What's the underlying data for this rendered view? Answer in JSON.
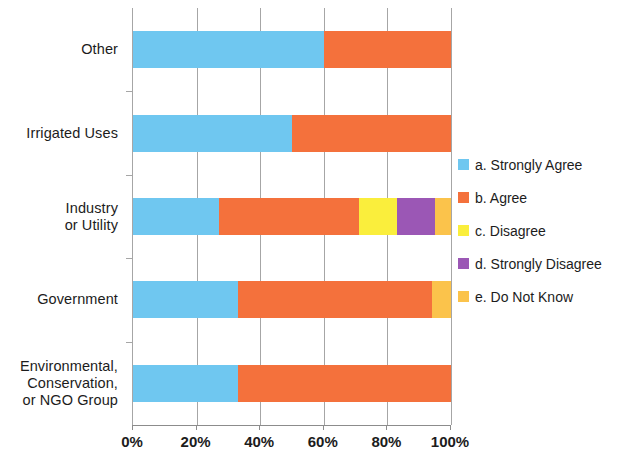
{
  "chart_data": {
    "type": "bar",
    "orientation": "horizontal",
    "stacked": true,
    "normalized": "100%",
    "title": "",
    "subtitle": "",
    "xlabel": "",
    "ylabel": "",
    "xlim": [
      0,
      100
    ],
    "xticks": [
      0,
      20,
      40,
      60,
      80,
      100
    ],
    "xtick_labels": [
      "0%",
      "20%",
      "40%",
      "60%",
      "80%",
      "100%"
    ],
    "grid": "vertical",
    "legend_position": "right",
    "categories": [
      "Other",
      "Irrigated Uses",
      "Industry\nor Utility",
      "Government",
      "Environmental,\nConservation,\nor NGO Group"
    ],
    "category_lines": [
      [
        "Other"
      ],
      [
        "Irrigated Uses"
      ],
      [
        "Industry",
        "or Utility"
      ],
      [
        "Government"
      ],
      [
        "Environmental,",
        "Conservation,",
        "or NGO Group"
      ]
    ],
    "series": [
      {
        "name": "a. Strongly Agree",
        "color": "#6FC7F0",
        "values": [
          60,
          50,
          27,
          33,
          33
        ]
      },
      {
        "name": "b. Agree",
        "color": "#F4713C",
        "values": [
          40,
          50,
          44,
          61,
          67
        ]
      },
      {
        "name": "c. Disagree",
        "color": "#FAEE3C",
        "values": [
          0,
          0,
          12,
          0,
          0
        ]
      },
      {
        "name": "d. Strongly Disagree",
        "color": "#9B57B5",
        "values": [
          0,
          0,
          12,
          0,
          0
        ]
      },
      {
        "name": "e. Do Not Know",
        "color": "#FBC34B",
        "values": [
          0,
          0,
          5,
          6,
          0
        ]
      }
    ]
  },
  "legend": {
    "items": [
      {
        "label": "a. Strongly Agree",
        "color": "#6FC7F0"
      },
      {
        "label": "b. Agree",
        "color": "#F4713C"
      },
      {
        "label": "c. Disagree",
        "color": "#FAEE3C"
      },
      {
        "label": "d. Strongly Disagree",
        "color": "#9B57B5"
      },
      {
        "label": "e. Do Not Know",
        "color": "#FBC34B"
      }
    ]
  },
  "axis": {
    "x_tick_labels": [
      "0%",
      "20%",
      "40%",
      "60%",
      "80%",
      "100%"
    ],
    "y_categories": [
      "Other",
      "Irrigated Uses",
      "Industry or Utility",
      "Government",
      "Environmental, Conservation, or NGO Group"
    ]
  },
  "colors": {
    "grid": "#a6a6a6",
    "axis": "#8c8c8c",
    "text": "#1c1c1c",
    "background": "#ffffff"
  }
}
